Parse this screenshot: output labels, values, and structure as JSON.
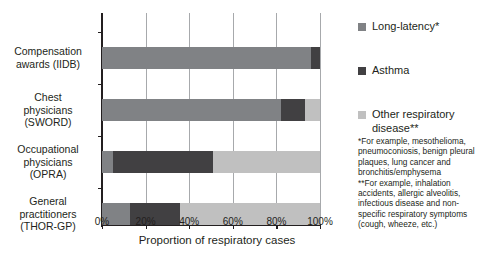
{
  "chart_data": {
    "type": "bar",
    "orientation": "horizontal",
    "stacked": true,
    "title": "",
    "xlabel": "Proportion of respiratory cases",
    "ylabel": "",
    "xlim": [
      0,
      100
    ],
    "xticks": [
      "0%",
      "20%",
      "40%",
      "60%",
      "80%",
      "100%"
    ],
    "xtick_values": [
      0,
      20,
      40,
      60,
      80,
      100
    ],
    "grid": true,
    "legend_position": "right",
    "categories": [
      "Compensation awards (IIDB)",
      "Chest physicians (SWORD)",
      "Occupational physicians (OPRA)",
      "General practitioners (THOR-GP)"
    ],
    "series": [
      {
        "name": "Long-latency*",
        "color": "#808285",
        "values": [
          96,
          82,
          5,
          13
        ]
      },
      {
        "name": "Asthma",
        "color": "#414042",
        "values": [
          4,
          11,
          46,
          23
        ]
      },
      {
        "name": "Other respiratory disease**",
        "color": "#c0c0c0",
        "values": [
          0,
          7,
          49,
          64
        ]
      }
    ]
  },
  "axis": {
    "x_title": "Proportion of respiratory cases"
  },
  "categories": [
    {
      "line1": "Compensation",
      "line2": "awards (IIDB)",
      "line3": ""
    },
    {
      "line1": "Chest",
      "line2": "physicians",
      "line3": "(SWORD)"
    },
    {
      "line1": "Occupational",
      "line2": "physicians",
      "line3": "(OPRA)"
    },
    {
      "line1": "General",
      "line2": "practitioners",
      "line3": "(THOR-GP)"
    }
  ],
  "legend": [
    {
      "label": "Long-latency*",
      "color": "#808285"
    },
    {
      "label": "Asthma",
      "color": "#414042"
    },
    {
      "label": "Other respiratory disease**",
      "color": "#c0c0c0"
    }
  ],
  "footnotes": {
    "line1": "*For example, mesothelioma,",
    "line2": "pneumoconiosis, benign pleural",
    "line3": "plaques, lung cancer and",
    "line4": "bronchitis/emphysema",
    "line5": "**For example, inhalation",
    "line6": "accidents, allergic alveolitis,",
    "line7": "infectious disease and non-",
    "line8": "specific respiratory symptoms",
    "line9": "(cough, wheeze, etc.)"
  }
}
